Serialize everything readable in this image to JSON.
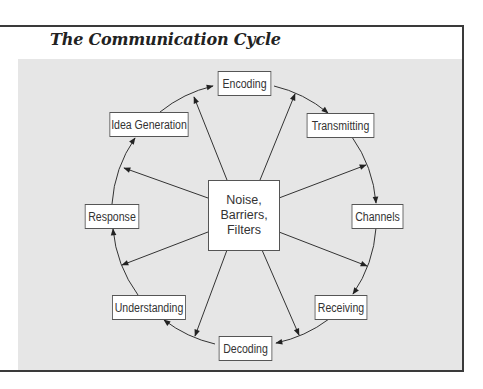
{
  "title": "The Communication Cycle",
  "colors": {
    "panel_bg": "#e6e6e6",
    "frame_border": "#3a3a3a",
    "line": "#333333",
    "box_bg": "#ffffff"
  },
  "center": {
    "lines": [
      "Noise,",
      "Barriers,",
      "Filters"
    ]
  },
  "cycle_nodes": [
    {
      "id": "encoding",
      "label": "Encoding"
    },
    {
      "id": "transmitting",
      "label": "Transmitting"
    },
    {
      "id": "channels",
      "label": "Channels"
    },
    {
      "id": "receiving",
      "label": "Receiving"
    },
    {
      "id": "decoding",
      "label": "Decoding"
    },
    {
      "id": "understanding",
      "label": "Understanding"
    },
    {
      "id": "response",
      "label": "Response"
    },
    {
      "id": "idea-generation",
      "label": "Idea Generation"
    }
  ],
  "flow": "clockwise: Idea Generation → Encoding → Transmitting → Channels → Receiving → Decoding → Understanding → Response → Idea Generation",
  "center_influence": "Noise, Barriers, Filters point outward to every stage of the cycle"
}
